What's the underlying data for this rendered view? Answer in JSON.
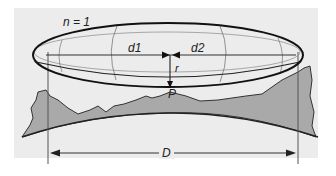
{
  "diagram": {
    "type": "fresnel-zone-diagram",
    "labels": {
      "zone_number": "n = 1",
      "distance_1": "d1",
      "distance_2": "d2",
      "radius": "r",
      "point": "P",
      "total_distance": "D"
    },
    "elements": [
      "fresnel-ellipsoid",
      "line-of-sight-axis",
      "terrain-profile",
      "earth-curvature",
      "left-antenna-mast",
      "right-antenna-mast",
      "total-distance-arrow"
    ],
    "colors": {
      "background": "#ececec",
      "terrain_fill": "#a9a9a9",
      "terrain_stroke": "#333333",
      "ellipse_stroke": "#111111",
      "guide_stroke": "#888888"
    }
  }
}
